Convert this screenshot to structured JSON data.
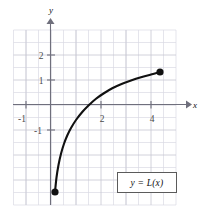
{
  "figure": {
    "kind": "cartesian-graph",
    "background_color": "#ffffff",
    "grid": {
      "visible": true,
      "minor_color": "#d8d8e2",
      "major_color": "#c2c2cf",
      "x_range": [
        -1.5,
        5.15
      ],
      "y_range": [
        -4.2,
        3.0
      ],
      "spacing_units": 0.5
    },
    "axes": {
      "x_label": "x",
      "y_label": "y",
      "axis_color": "#6b6b78",
      "x_ticks": [
        {
          "value": -1,
          "label": "-1"
        },
        {
          "value": 2,
          "label": "2"
        },
        {
          "value": 4,
          "label": "4"
        }
      ],
      "y_ticks": [
        {
          "value": 2,
          "label": "2"
        },
        {
          "value": 1,
          "label": "1"
        },
        {
          "value": -1,
          "label": "-1"
        }
      ]
    }
  },
  "chart_data": {
    "type": "line",
    "title": "",
    "subtitle": "",
    "xlabel": "x",
    "ylabel": "y",
    "xlim": [
      -1.5,
      5.15
    ],
    "ylim": [
      -4.2,
      3.0
    ],
    "grid": true,
    "legend_position": "inside-bottom-right",
    "series": [
      {
        "name": "y = L(x)",
        "color": "#111111",
        "endpoints_marked": true,
        "x": [
          0.16,
          0.22,
          0.3,
          0.4,
          0.52,
          0.65,
          0.8,
          1.0,
          1.25,
          1.5,
          1.8,
          2.1,
          2.45,
          2.8,
          3.2,
          3.6,
          4.0,
          4.36
        ],
        "y": [
          -3.48,
          -2.9,
          -2.4,
          -1.95,
          -1.55,
          -1.22,
          -0.92,
          -0.6,
          -0.28,
          -0.02,
          0.25,
          0.46,
          0.67,
          0.83,
          0.98,
          1.11,
          1.22,
          1.32
        ]
      }
    ],
    "markers": [
      {
        "name": "left-endpoint",
        "x": 0.16,
        "y": -3.48,
        "style": "filled-circle",
        "color": "#111111"
      },
      {
        "name": "right-endpoint",
        "x": 4.36,
        "y": 1.32,
        "style": "filled-circle",
        "color": "#111111"
      }
    ],
    "annotations": [
      {
        "name": "curve-legend",
        "text": "y = L(x)",
        "x": 4.0,
        "y": -2.9,
        "boxed": true
      }
    ]
  },
  "legend": {
    "label": "y = L(x)"
  }
}
